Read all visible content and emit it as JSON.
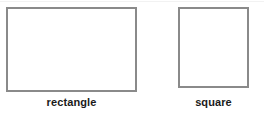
{
  "canvas": {
    "width": 264,
    "height": 114,
    "background_color": "#ffffff"
  },
  "style": {
    "outline_color": "#8a8a8a",
    "fill_color": "#ffffff",
    "label_color": "#1a1a1a",
    "artifact_line_color": "#f2f2f2"
  },
  "shapes": [
    {
      "name": "rectangle",
      "label": "rectangle",
      "kind": "rectangle",
      "x": 6,
      "y": 7,
      "width": 131,
      "height": 85,
      "border_width": 2,
      "outline_color": "#8a8a8a",
      "fill_color": "#ffffff"
    },
    {
      "name": "square",
      "label": "square",
      "kind": "square",
      "x": 178,
      "y": 7,
      "width": 71,
      "height": 81,
      "border_width": 2,
      "outline_color": "#8a8a8a",
      "fill_color": "#ffffff"
    }
  ]
}
